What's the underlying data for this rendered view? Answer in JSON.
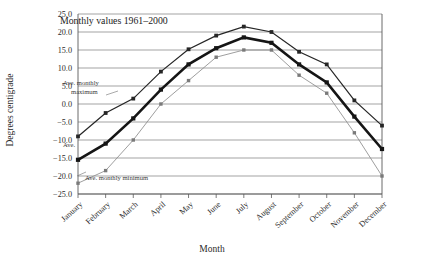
{
  "chart_data": {
    "type": "line",
    "title": "Monthly values 1961–2000",
    "xlabel": "Month",
    "ylabel": "Degrees centigrade",
    "categories": [
      "January",
      "February",
      "March",
      "April",
      "May",
      "June",
      "July",
      "August",
      "September",
      "October",
      "November",
      "December"
    ],
    "ylim": [
      -25.0,
      25.0
    ],
    "ytick_step": 5.0,
    "yticks": [
      "25.0",
      "20.0",
      "15.0",
      "10.0",
      "5.0",
      "0.0",
      "-5.0",
      "-10.0",
      "-15.0",
      "-20.0",
      "-25.0"
    ],
    "grid": true,
    "legend_position": "inline-annotations",
    "series": [
      {
        "name": "Ave. monthly maximum",
        "values": [
          -9.0,
          -2.5,
          1.5,
          9.0,
          15.2,
          19.0,
          21.5,
          20.0,
          14.5,
          11.0,
          1.0,
          -6.0
        ]
      },
      {
        "name": "Ave.",
        "values": [
          -15.5,
          -11.0,
          -4.0,
          4.0,
          11.0,
          15.5,
          18.5,
          17.0,
          11.0,
          6.0,
          -3.5,
          -12.5
        ]
      },
      {
        "name": "Ave. monthly minimum",
        "values": [
          -22.0,
          -18.5,
          -10.0,
          0.0,
          6.5,
          13.0,
          15.0,
          15.0,
          8.0,
          3.0,
          -8.0,
          -20.0
        ]
      }
    ],
    "annotations": [
      {
        "text": "Ave. monthly maximum",
        "series": "Ave. monthly maximum"
      },
      {
        "text": "Ave.",
        "series": "Ave."
      },
      {
        "text": "Ave. monthly minimum",
        "series": "Ave. monthly minimum"
      }
    ]
  }
}
